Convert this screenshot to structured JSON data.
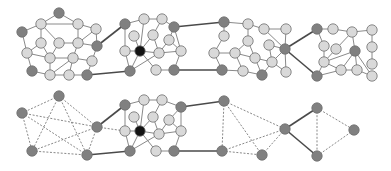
{
  "colors": {
    "node_light": "#d9d9d9",
    "node_dark": "#808080",
    "node_black": "#141414",
    "edge_thin": "#8a8a8a",
    "edge_bridge": "#4a4a4a",
    "edge_dashed": "#7a7a7a"
  },
  "node_radius": 5.2,
  "top_graph": {
    "nodes": [
      {
        "id": "a1",
        "x": 59,
        "y": 13,
        "type": "dark"
      },
      {
        "id": "a2",
        "x": 22,
        "y": 32,
        "type": "dark"
      },
      {
        "id": "a3",
        "x": 97,
        "y": 46,
        "type": "dark"
      },
      {
        "id": "a4",
        "x": 32,
        "y": 71,
        "type": "dark"
      },
      {
        "id": "a5",
        "x": 87,
        "y": 75,
        "type": "dark"
      },
      {
        "id": "a6",
        "x": 41,
        "y": 24,
        "type": "light"
      },
      {
        "id": "a7",
        "x": 78,
        "y": 24,
        "type": "light"
      },
      {
        "id": "a8",
        "x": 96,
        "y": 29,
        "type": "light"
      },
      {
        "id": "a9",
        "x": 41,
        "y": 43,
        "type": "light"
      },
      {
        "id": "a10",
        "x": 59,
        "y": 43,
        "type": "light"
      },
      {
        "id": "a11",
        "x": 78,
        "y": 43,
        "type": "light"
      },
      {
        "id": "a12",
        "x": 27,
        "y": 53,
        "type": "light"
      },
      {
        "id": "a13",
        "x": 50,
        "y": 58,
        "type": "light"
      },
      {
        "id": "a14",
        "x": 73,
        "y": 58,
        "type": "light"
      },
      {
        "id": "a15",
        "x": 92,
        "y": 61,
        "type": "light"
      },
      {
        "id": "a16",
        "x": 50,
        "y": 75,
        "type": "light"
      },
      {
        "id": "a17",
        "x": 69,
        "y": 75,
        "type": "light"
      },
      {
        "id": "b1",
        "x": 125,
        "y": 24,
        "type": "dark"
      },
      {
        "id": "b2",
        "x": 130,
        "y": 71,
        "type": "dark"
      },
      {
        "id": "b3",
        "x": 174,
        "y": 27,
        "type": "dark"
      },
      {
        "id": "b4",
        "x": 174,
        "y": 70,
        "type": "dark"
      },
      {
        "id": "b5",
        "x": 140,
        "y": 51,
        "type": "black"
      },
      {
        "id": "b6",
        "x": 144,
        "y": 19,
        "type": "light"
      },
      {
        "id": "b7",
        "x": 162,
        "y": 19,
        "type": "light"
      },
      {
        "id": "b8",
        "x": 134,
        "y": 36,
        "type": "light"
      },
      {
        "id": "b9",
        "x": 153,
        "y": 35,
        "type": "light"
      },
      {
        "id": "b10",
        "x": 169,
        "y": 40,
        "type": "light"
      },
      {
        "id": "b11",
        "x": 125,
        "y": 51,
        "type": "light"
      },
      {
        "id": "b12",
        "x": 159,
        "y": 53,
        "type": "light"
      },
      {
        "id": "b13",
        "x": 181,
        "y": 51,
        "type": "light"
      },
      {
        "id": "b14",
        "x": 156,
        "y": 70,
        "type": "light"
      },
      {
        "id": "c1",
        "x": 224,
        "y": 22,
        "type": "dark"
      },
      {
        "id": "c2",
        "x": 222,
        "y": 70,
        "type": "dark"
      },
      {
        "id": "c3",
        "x": 262,
        "y": 75,
        "type": "dark"
      },
      {
        "id": "c4",
        "x": 285,
        "y": 49,
        "type": "dark"
      },
      {
        "id": "c5",
        "x": 248,
        "y": 24,
        "type": "light"
      },
      {
        "id": "c6",
        "x": 264,
        "y": 29,
        "type": "light"
      },
      {
        "id": "c7",
        "x": 224,
        "y": 36,
        "type": "light"
      },
      {
        "id": "c8",
        "x": 248,
        "y": 41,
        "type": "light"
      },
      {
        "id": "c9",
        "x": 286,
        "y": 29,
        "type": "light"
      },
      {
        "id": "c10",
        "x": 269,
        "y": 45,
        "type": "light"
      },
      {
        "id": "c11",
        "x": 214,
        "y": 53,
        "type": "light"
      },
      {
        "id": "c12",
        "x": 235,
        "y": 53,
        "type": "light"
      },
      {
        "id": "c13",
        "x": 255,
        "y": 58,
        "type": "light"
      },
      {
        "id": "c14",
        "x": 272,
        "y": 62,
        "type": "light"
      },
      {
        "id": "c15",
        "x": 243,
        "y": 71,
        "type": "light"
      },
      {
        "id": "c16",
        "x": 286,
        "y": 72,
        "type": "light"
      },
      {
        "id": "d1",
        "x": 317,
        "y": 29,
        "type": "dark"
      },
      {
        "id": "d2",
        "x": 355,
        "y": 51,
        "type": "dark"
      },
      {
        "id": "d3",
        "x": 317,
        "y": 76,
        "type": "dark"
      },
      {
        "id": "d4",
        "x": 333,
        "y": 29,
        "type": "light"
      },
      {
        "id": "d5",
        "x": 352,
        "y": 32,
        "type": "light"
      },
      {
        "id": "d6",
        "x": 372,
        "y": 30,
        "type": "light"
      },
      {
        "id": "d7",
        "x": 324,
        "y": 46,
        "type": "light"
      },
      {
        "id": "d8",
        "x": 336,
        "y": 49,
        "type": "light"
      },
      {
        "id": "d9",
        "x": 372,
        "y": 47,
        "type": "light"
      },
      {
        "id": "d10",
        "x": 324,
        "y": 62,
        "type": "light"
      },
      {
        "id": "d11",
        "x": 341,
        "y": 70,
        "type": "light"
      },
      {
        "id": "d12",
        "x": 357,
        "y": 70,
        "type": "light"
      },
      {
        "id": "d13",
        "x": 372,
        "y": 64,
        "type": "light"
      },
      {
        "id": "d14",
        "x": 372,
        "y": 76,
        "type": "light"
      }
    ],
    "edges": [
      [
        "a1",
        "a6"
      ],
      [
        "a6",
        "a7"
      ],
      [
        "a1",
        "a7"
      ],
      [
        "a6",
        "a2"
      ],
      [
        "a6",
        "a9"
      ],
      [
        "a6",
        "a10"
      ],
      [
        "a7",
        "a8"
      ],
      [
        "a7",
        "a11"
      ],
      [
        "a8",
        "a3"
      ],
      [
        "a8",
        "a11"
      ],
      [
        "a2",
        "a12"
      ],
      [
        "a9",
        "a12"
      ],
      [
        "a9",
        "a13"
      ],
      [
        "a10",
        "a11"
      ],
      [
        "a10",
        "a13"
      ],
      [
        "a11",
        "a14"
      ],
      [
        "a11",
        "a3"
      ],
      [
        "a3",
        "a15"
      ],
      [
        "a12",
        "a13"
      ],
      [
        "a12",
        "a4"
      ],
      [
        "a13",
        "a14"
      ],
      [
        "a13",
        "a16"
      ],
      [
        "a14",
        "a16"
      ],
      [
        "a14",
        "a17"
      ],
      [
        "a14",
        "a15"
      ],
      [
        "a15",
        "a5"
      ],
      [
        "a4",
        "a16"
      ],
      [
        "a16",
        "a17"
      ],
      [
        "a17",
        "a5"
      ],
      [
        "b1",
        "b6"
      ],
      [
        "b6",
        "b7"
      ],
      [
        "b6",
        "b5"
      ],
      [
        "b7",
        "b3"
      ],
      [
        "b7",
        "b9"
      ],
      [
        "b1",
        "b11"
      ],
      [
        "b8",
        "b5"
      ],
      [
        "b9",
        "b5"
      ],
      [
        "b9",
        "b12"
      ],
      [
        "b10",
        "b3"
      ],
      [
        "b10",
        "b12"
      ],
      [
        "b10",
        "b13"
      ],
      [
        "b3",
        "b13"
      ],
      [
        "b11",
        "b5"
      ],
      [
        "b11",
        "b2"
      ],
      [
        "b5",
        "b2"
      ],
      [
        "b5",
        "b12"
      ],
      [
        "b5",
        "b14"
      ],
      [
        "b12",
        "b2"
      ],
      [
        "b12",
        "b13"
      ],
      [
        "b13",
        "b4"
      ],
      [
        "b14",
        "b4"
      ],
      [
        "c1",
        "c5"
      ],
      [
        "c1",
        "c7"
      ],
      [
        "c5",
        "c6"
      ],
      [
        "c5",
        "c8"
      ],
      [
        "c6",
        "c9"
      ],
      [
        "c6",
        "c4"
      ],
      [
        "c7",
        "c11"
      ],
      [
        "c8",
        "c12"
      ],
      [
        "c8",
        "c13"
      ],
      [
        "c9",
        "c4"
      ],
      [
        "c10",
        "c4"
      ],
      [
        "c10",
        "c14"
      ],
      [
        "c11",
        "c12"
      ],
      [
        "c11",
        "c2"
      ],
      [
        "c12",
        "c13"
      ],
      [
        "c12",
        "c15"
      ],
      [
        "c13",
        "c14"
      ],
      [
        "c13",
        "c3"
      ],
      [
        "c14",
        "c4"
      ],
      [
        "c14",
        "c3"
      ],
      [
        "c14",
        "c16"
      ],
      [
        "c4",
        "c16"
      ],
      [
        "c2",
        "c15"
      ],
      [
        "c15",
        "c3"
      ],
      [
        "d1",
        "d4"
      ],
      [
        "d4",
        "d5"
      ],
      [
        "d1",
        "d7"
      ],
      [
        "d5",
        "d6"
      ],
      [
        "d5",
        "d8"
      ],
      [
        "d5",
        "d2"
      ],
      [
        "d6",
        "d9"
      ],
      [
        "d7",
        "d10"
      ],
      [
        "d8",
        "d10"
      ],
      [
        "d2",
        "d10"
      ],
      [
        "d2",
        "d11"
      ],
      [
        "d2",
        "d12"
      ],
      [
        "d2",
        "d14"
      ],
      [
        "d9",
        "d13"
      ],
      [
        "d10",
        "d3"
      ],
      [
        "d10",
        "d11"
      ],
      [
        "d11",
        "d12"
      ],
      [
        "d12",
        "d14"
      ],
      [
        "d3",
        "d11"
      ]
    ],
    "bridges": [
      [
        "a3",
        "b1"
      ],
      [
        "a5",
        "b2"
      ],
      [
        "b3",
        "c1"
      ],
      [
        "b4",
        "c2"
      ],
      [
        "c4",
        "d1"
      ],
      [
        "c4",
        "d3"
      ]
    ]
  },
  "bottom_graph": {
    "nodes": [
      {
        "id": "p1",
        "x": 59,
        "y": 96,
        "type": "dark"
      },
      {
        "id": "p2",
        "x": 22,
        "y": 113,
        "type": "dark"
      },
      {
        "id": "p3",
        "x": 97,
        "y": 127,
        "type": "dark"
      },
      {
        "id": "p4",
        "x": 32,
        "y": 151,
        "type": "dark"
      },
      {
        "id": "p5",
        "x": 87,
        "y": 155,
        "type": "dark"
      },
      {
        "id": "q1",
        "x": 125,
        "y": 105,
        "type": "dark"
      },
      {
        "id": "q2",
        "x": 130,
        "y": 151,
        "type": "dark"
      },
      {
        "id": "q3",
        "x": 181,
        "y": 107,
        "type": "dark"
      },
      {
        "id": "q4",
        "x": 174,
        "y": 151,
        "type": "dark"
      },
      {
        "id": "q5",
        "x": 140,
        "y": 131,
        "type": "black"
      },
      {
        "id": "q6",
        "x": 144,
        "y": 100,
        "type": "light"
      },
      {
        "id": "q7",
        "x": 162,
        "y": 100,
        "type": "light"
      },
      {
        "id": "q8",
        "x": 134,
        "y": 117,
        "type": "light"
      },
      {
        "id": "q9",
        "x": 153,
        "y": 117,
        "type": "light"
      },
      {
        "id": "q10",
        "x": 169,
        "y": 120,
        "type": "light"
      },
      {
        "id": "q11",
        "x": 125,
        "y": 131,
        "type": "light"
      },
      {
        "id": "q12",
        "x": 159,
        "y": 134,
        "type": "light"
      },
      {
        "id": "q13",
        "x": 181,
        "y": 131,
        "type": "light"
      },
      {
        "id": "q14",
        "x": 156,
        "y": 151,
        "type": "light"
      },
      {
        "id": "r1",
        "x": 224,
        "y": 101,
        "type": "dark"
      },
      {
        "id": "r2",
        "x": 222,
        "y": 151,
        "type": "dark"
      },
      {
        "id": "r3",
        "x": 262,
        "y": 155,
        "type": "dark"
      },
      {
        "id": "r4",
        "x": 285,
        "y": 129,
        "type": "dark"
      },
      {
        "id": "s1",
        "x": 317,
        "y": 108,
        "type": "dark"
      },
      {
        "id": "s2",
        "x": 354,
        "y": 130,
        "type": "dark"
      },
      {
        "id": "s3",
        "x": 317,
        "y": 156,
        "type": "dark"
      }
    ],
    "edges": [
      [
        "q1",
        "q6"
      ],
      [
        "q6",
        "q7"
      ],
      [
        "q6",
        "q5"
      ],
      [
        "q7",
        "q3"
      ],
      [
        "q7",
        "q9"
      ],
      [
        "q1",
        "q11"
      ],
      [
        "q8",
        "q5"
      ],
      [
        "q9",
        "q5"
      ],
      [
        "q9",
        "q12"
      ],
      [
        "q10",
        "q3"
      ],
      [
        "q10",
        "q12"
      ],
      [
        "q10",
        "q13"
      ],
      [
        "q3",
        "q13"
      ],
      [
        "q11",
        "q5"
      ],
      [
        "q11",
        "q2"
      ],
      [
        "q5",
        "q2"
      ],
      [
        "q5",
        "q12"
      ],
      [
        "q5",
        "q14"
      ],
      [
        "q12",
        "q2"
      ],
      [
        "q12",
        "q13"
      ],
      [
        "q13",
        "q4"
      ],
      [
        "q14",
        "q4"
      ]
    ],
    "dashed_edges": [
      [
        "p1",
        "p2"
      ],
      [
        "p1",
        "p3"
      ],
      [
        "p1",
        "p4"
      ],
      [
        "p1",
        "p5"
      ],
      [
        "p2",
        "p3"
      ],
      [
        "p2",
        "p4"
      ],
      [
        "p2",
        "p5"
      ],
      [
        "p3",
        "p4"
      ],
      [
        "p3",
        "p5"
      ],
      [
        "p4",
        "p5"
      ],
      [
        "p3",
        "q11"
      ],
      [
        "r1",
        "r2"
      ],
      [
        "r1",
        "r3"
      ],
      [
        "r1",
        "r4"
      ],
      [
        "r2",
        "r3"
      ],
      [
        "r2",
        "r4"
      ],
      [
        "r3",
        "r4"
      ],
      [
        "s1",
        "s2"
      ],
      [
        "s1",
        "s3"
      ],
      [
        "s2",
        "s3"
      ]
    ],
    "bridges": [
      [
        "p3",
        "q1"
      ],
      [
        "p5",
        "q2"
      ],
      [
        "q3",
        "r1"
      ],
      [
        "q4",
        "r2"
      ],
      [
        "r4",
        "s1"
      ],
      [
        "r4",
        "s3"
      ]
    ]
  }
}
